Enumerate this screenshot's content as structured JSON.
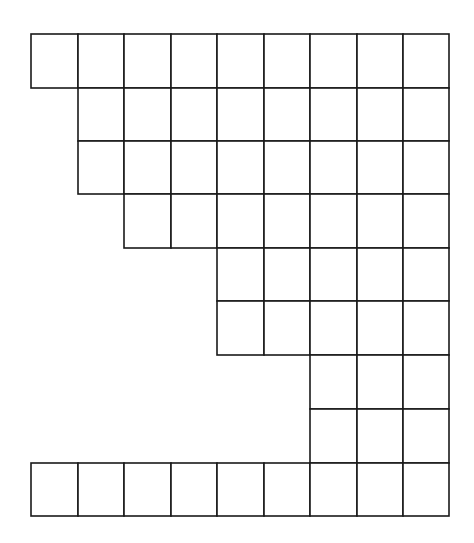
{
  "diagram": {
    "type": "cell-grid",
    "columns": 9,
    "rows": 9,
    "line_color": "#1a1a1a",
    "background": "#ffffff",
    "column_edges_px": [
      31,
      78,
      124,
      171,
      217,
      264,
      310,
      357,
      403,
      449
    ],
    "row_edges_px": [
      34,
      88,
      141,
      194,
      248,
      301,
      355,
      409,
      463,
      516
    ],
    "row_start_columns": [
      0,
      1,
      1,
      2,
      4,
      4,
      6,
      6,
      0
    ],
    "row_cell_counts": [
      9,
      8,
      8,
      7,
      5,
      5,
      3,
      3,
      9
    ]
  }
}
